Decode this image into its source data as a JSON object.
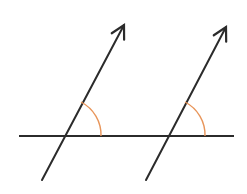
{
  "diagram": {
    "colors": {
      "line": "#2b2b2b",
      "angle_arc": "#e8955a",
      "background": "#ffffff"
    },
    "transversal": {
      "x1": 19,
      "y1": 136,
      "x2": 234,
      "y2": 136
    },
    "arrows": [
      {
        "id": "left",
        "x1": 42,
        "y1": 180,
        "x2": 124,
        "y2": 25
      },
      {
        "id": "right",
        "x1": 146,
        "y1": 180,
        "x2": 226,
        "y2": 27
      }
    ],
    "angles": [
      {
        "id": "left-angle",
        "path": "M 81 102 A 37 37 0 0 1 101 136"
      },
      {
        "id": "right-angle",
        "path": "M 185 102 A 37 37 0 0 1 205 136"
      }
    ]
  }
}
